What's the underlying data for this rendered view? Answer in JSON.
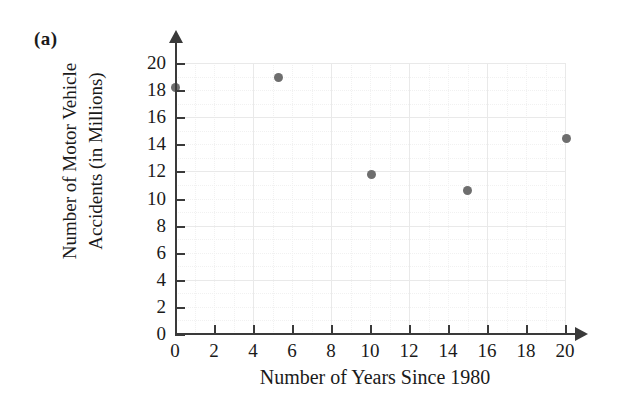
{
  "figure": {
    "part_label": "(a)",
    "background_color": "#ffffff"
  },
  "chart_data": {
    "type": "scatter",
    "title": "",
    "xlabel": "Number of Years Since 1980",
    "ylabel_line1": "Number of Motor Vehicle",
    "ylabel_line2": "Accidents (in Millions)",
    "ylabel": "Number of Motor Vehicle Accidents (in Millions)",
    "xlim": [
      0,
      20
    ],
    "ylim": [
      0,
      20
    ],
    "xticks": [
      0,
      2,
      4,
      6,
      8,
      10,
      12,
      14,
      16,
      18,
      20
    ],
    "yticks": [
      0,
      2,
      4,
      6,
      8,
      10,
      12,
      14,
      16,
      18,
      20
    ],
    "xtick_labels": [
      "0",
      "2",
      "4",
      "6",
      "8",
      "10",
      "12",
      "14",
      "16",
      "18",
      "20"
    ],
    "ytick_labels": [
      "0",
      "2",
      "4",
      "6",
      "8",
      "10",
      "12",
      "14",
      "16",
      "18",
      "20"
    ],
    "grid": true,
    "legend": "none",
    "marker_color": "#6e6e6e",
    "axis_color": "#3a3a3a",
    "grid_color": "#e9e9e9",
    "x": [
      0,
      5.3,
      10.1,
      15.0,
      20.1
    ],
    "y": [
      18.2,
      18.9,
      11.8,
      10.6,
      14.4
    ],
    "points": [
      {
        "x": 0,
        "y": 18.2
      },
      {
        "x": 5.3,
        "y": 18.9
      },
      {
        "x": 10.1,
        "y": 11.8
      },
      {
        "x": 15.0,
        "y": 10.6
      },
      {
        "x": 20.1,
        "y": 14.4
      }
    ]
  }
}
